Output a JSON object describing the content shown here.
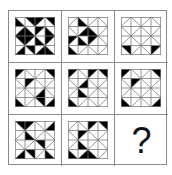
{
  "puzzle": {
    "rows": 3,
    "cols": 3,
    "tile_grid": 4,
    "colors": {
      "fill": "#000000",
      "line": "#7a7a7a",
      "background": "#ffffff",
      "frame": "#8a8a8a"
    },
    "answer_placeholder": "?",
    "tiles": [
      [
        [
          [
            "b",
            "bl"
          ],
          [
            "b",
            "tr"
          ],
          [
            "f",
            "tl"
          ],
          [
            "b",
            "tr"
          ]
        ],
        [
          [
            "f",
            "br"
          ],
          [
            "b",
            "bl"
          ],
          [
            "f",
            "tl"
          ],
          [
            "b",
            "br"
          ]
        ],
        [
          [
            "b",
            "tr"
          ],
          [
            "f",
            "tl"
          ],
          [
            "b",
            "bl"
          ],
          [
            "f",
            "tr"
          ]
        ],
        [
          [
            "f",
            "bl"
          ],
          [
            "b",
            "tr"
          ],
          [
            "f",
            "br"
          ],
          [
            "b",
            "bl"
          ]
        ]
      ],
      [
        [
          [
            "f",
            ""
          ],
          [
            "b",
            "bl"
          ],
          [
            "f",
            ""
          ],
          [
            "b",
            ""
          ]
        ],
        [
          [
            "b",
            ""
          ],
          [
            "f",
            "br"
          ],
          [
            "b",
            "bl"
          ],
          [
            "f",
            ""
          ]
        ],
        [
          [
            "f",
            "tl"
          ],
          [
            "b",
            "br"
          ],
          [
            "f",
            "tl"
          ],
          [
            "b",
            ""
          ]
        ],
        [
          [
            "b",
            "bl"
          ],
          [
            "f",
            ""
          ],
          [
            "b",
            ""
          ],
          [
            "f",
            ""
          ]
        ]
      ],
      [
        [
          [
            "f",
            ""
          ],
          [
            "b",
            ""
          ],
          [
            "f",
            ""
          ],
          [
            "b",
            ""
          ]
        ],
        [
          [
            "b",
            ""
          ],
          [
            "f",
            ""
          ],
          [
            "b",
            ""
          ],
          [
            "f",
            ""
          ]
        ],
        [
          [
            "f",
            ""
          ],
          [
            "b",
            ""
          ],
          [
            "f",
            ""
          ],
          [
            "b",
            ""
          ]
        ],
        [
          [
            "b",
            "tr"
          ],
          [
            "f",
            ""
          ],
          [
            "b",
            ""
          ],
          [
            "f",
            "tl"
          ]
        ]
      ],
      [
        [
          [
            "f",
            "tl"
          ],
          [
            "b",
            ""
          ],
          [
            "f",
            ""
          ],
          [
            "b",
            "tr"
          ]
        ],
        [
          [
            "b",
            ""
          ],
          [
            "f",
            "tl"
          ],
          [
            "b",
            ""
          ],
          [
            "f",
            ""
          ]
        ],
        [
          [
            "f",
            ""
          ],
          [
            "b",
            ""
          ],
          [
            "f",
            "br"
          ],
          [
            "b",
            ""
          ]
        ],
        [
          [
            "b",
            "bl"
          ],
          [
            "f",
            ""
          ],
          [
            "b",
            "tr"
          ],
          [
            "f",
            "br"
          ]
        ]
      ],
      [
        [
          [
            "f",
            "tl"
          ],
          [
            "b",
            ""
          ],
          [
            "f",
            "tl"
          ],
          [
            "b",
            "tr"
          ]
        ],
        [
          [
            "b",
            ""
          ],
          [
            "f",
            "br"
          ],
          [
            "b",
            ""
          ],
          [
            "f",
            ""
          ]
        ],
        [
          [
            "f",
            ""
          ],
          [
            "b",
            "bl"
          ],
          [
            "f",
            ""
          ],
          [
            "b",
            ""
          ]
        ],
        [
          [
            "b",
            "bl"
          ],
          [
            "f",
            ""
          ],
          [
            "b",
            ""
          ],
          [
            "f",
            ""
          ]
        ]
      ],
      [
        [
          [
            "f",
            "tl"
          ],
          [
            "b",
            ""
          ],
          [
            "f",
            ""
          ],
          [
            "b",
            "tr"
          ]
        ],
        [
          [
            "b",
            ""
          ],
          [
            "f",
            "tr"
          ],
          [
            "b",
            ""
          ],
          [
            "f",
            ""
          ]
        ],
        [
          [
            "f",
            ""
          ],
          [
            "b",
            ""
          ],
          [
            "f",
            ""
          ],
          [
            "b",
            ""
          ]
        ],
        [
          [
            "b",
            "bl"
          ],
          [
            "f",
            ""
          ],
          [
            "b",
            ""
          ],
          [
            "f",
            "br"
          ]
        ]
      ],
      [
        [
          [
            "b",
            "tr"
          ],
          [
            "f",
            "tl"
          ],
          [
            "b",
            ""
          ],
          [
            "f",
            "br"
          ]
        ],
        [
          [
            "f",
            ""
          ],
          [
            "b",
            "bl"
          ],
          [
            "f",
            ""
          ],
          [
            "b",
            ""
          ]
        ],
        [
          [
            "b",
            ""
          ],
          [
            "f",
            ""
          ],
          [
            "b",
            "tr"
          ],
          [
            "f",
            ""
          ]
        ],
        [
          [
            "f",
            "bl"
          ],
          [
            "b",
            "tr"
          ],
          [
            "f",
            ""
          ],
          [
            "b",
            "bl"
          ]
        ]
      ],
      [
        [
          [
            "f",
            ""
          ],
          [
            "b",
            ""
          ],
          [
            "f",
            "tl"
          ],
          [
            "b",
            "tr"
          ]
        ],
        [
          [
            "b",
            ""
          ],
          [
            "f",
            "tl"
          ],
          [
            "b",
            ""
          ],
          [
            "f",
            ""
          ]
        ],
        [
          [
            "f",
            ""
          ],
          [
            "b",
            "bl"
          ],
          [
            "f",
            ""
          ],
          [
            "b",
            ""
          ]
        ],
        [
          [
            "b",
            "bl"
          ],
          [
            "f",
            "br"
          ],
          [
            "b",
            "bl"
          ],
          [
            "f",
            ""
          ]
        ]
      ],
      null
    ]
  }
}
